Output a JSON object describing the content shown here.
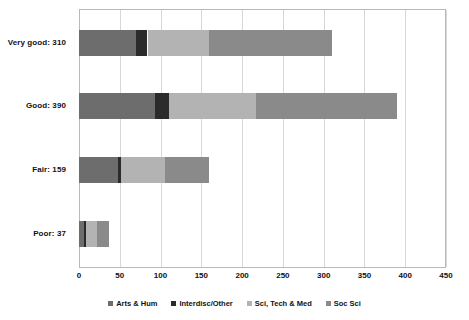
{
  "chart_data": {
    "type": "bar",
    "orientation": "horizontal",
    "stacked": true,
    "title": "",
    "xlabel": "",
    "ylabel": "",
    "xlim": [
      0,
      450
    ],
    "xticks": [
      "0",
      "50",
      "100",
      "150",
      "200",
      "250",
      "300",
      "350",
      "400",
      "450"
    ],
    "grid": true,
    "legend_position": "bottom",
    "categories": [
      "Very good: 310",
      "Good: 390",
      "Fair: 159",
      "Poor: 37"
    ],
    "category_totals": [
      310,
      390,
      159,
      37
    ],
    "series": [
      {
        "name": "Arts & Hum",
        "color": "#6d6d6d",
        "values": [
          70,
          93,
          48,
          6
        ]
      },
      {
        "name": "Interdisc/Other",
        "color": "#2b2b2b",
        "values": [
          14,
          17,
          4,
          3
        ]
      },
      {
        "name": "Sci, Tech & Med",
        "color": "#b3b3b3",
        "values": [
          76,
          107,
          54,
          13
        ]
      },
      {
        "name": "Soc Sci",
        "color": "#8a8a8a",
        "values": [
          150,
          173,
          53,
          15
        ]
      }
    ]
  },
  "axis": {
    "ticks": [
      {
        "label": "0",
        "value": 0
      },
      {
        "label": "50",
        "value": 50
      },
      {
        "label": "100",
        "value": 100
      },
      {
        "label": "150",
        "value": 150
      },
      {
        "label": "200",
        "value": 200
      },
      {
        "label": "250",
        "value": 250
      },
      {
        "label": "300",
        "value": 300
      },
      {
        "label": "350",
        "value": 350
      },
      {
        "label": "400",
        "value": 400
      },
      {
        "label": "450",
        "value": 450
      }
    ]
  },
  "legend": {
    "items": [
      {
        "label": "Arts & Hum",
        "color": "#6d6d6d"
      },
      {
        "label": "Interdisc/Other",
        "color": "#2b2b2b"
      },
      {
        "label": "Sci, Tech & Med",
        "color": "#b3b3b3"
      },
      {
        "label": "Soc Sci",
        "color": "#8a8a8a"
      }
    ]
  }
}
